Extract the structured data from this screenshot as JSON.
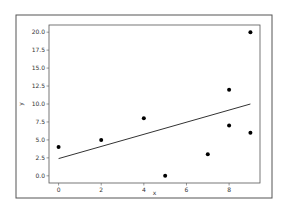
{
  "chart_data": {
    "type": "scatter",
    "title": "",
    "xlabel": "x",
    "ylabel": "y",
    "xlim": [
      -0.45,
      9.45
    ],
    "ylim": [
      -1.0,
      21.0
    ],
    "xticks": [
      0,
      2,
      4,
      6,
      8
    ],
    "xtick_labels": [
      "0",
      "2",
      "4",
      "6",
      "8"
    ],
    "yticks": [
      0.0,
      2.5,
      5.0,
      7.5,
      10.0,
      12.5,
      15.0,
      17.5,
      20.0
    ],
    "ytick_labels": [
      "0.0",
      "2.5",
      "5.0",
      "7.5",
      "10.0",
      "12.5",
      "15.0",
      "17.5",
      "20.0"
    ],
    "grid": false,
    "legend": null,
    "series": [
      {
        "name": "data",
        "type": "scatter",
        "color": "#000000",
        "x": [
          0,
          2,
          4,
          5,
          7,
          8,
          8,
          9,
          9
        ],
        "y": [
          4,
          5,
          8,
          0,
          3,
          12,
          7,
          20,
          6
        ]
      },
      {
        "name": "fit",
        "type": "line",
        "color": "#333333",
        "x": [
          0,
          9
        ],
        "y": [
          2.4,
          10.0
        ]
      }
    ]
  }
}
